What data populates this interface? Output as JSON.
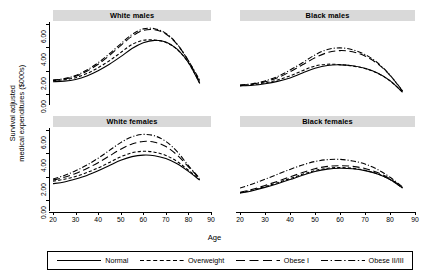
{
  "chart_data": {
    "type": "line",
    "title": "",
    "xlabel": "Age",
    "ylabel": "Survival adjusted\nmedical expenditures ($000s)",
    "xlim": [
      20,
      90
    ],
    "ylim": [
      0,
      6
    ],
    "xticks": [
      "20",
      "30",
      "40",
      "50",
      "60",
      "70",
      "80",
      "90"
    ],
    "yticks": [
      "0.00",
      "2.00",
      "4.00",
      "6.00"
    ],
    "grid": false,
    "legend_position": "bottom",
    "series_names": [
      "Normal",
      "Overweight",
      "Obese I",
      "Obese II/III"
    ],
    "line_styles": [
      "solid",
      "dashed",
      "long-dash",
      "dash-dot"
    ],
    "panels": [
      {
        "name": "White males",
        "x": [
          20,
          25,
          30,
          35,
          40,
          45,
          50,
          55,
          60,
          65,
          70,
          75,
          80,
          85
        ],
        "series": [
          {
            "name": "Normal",
            "values": [
              1.05,
              1.1,
              1.25,
              1.55,
              2.0,
              2.55,
              3.2,
              3.9,
              4.4,
              4.6,
              4.45,
              3.85,
              2.7,
              0.9
            ]
          },
          {
            "name": "Overweight",
            "values": [
              1.15,
              1.22,
              1.4,
              1.75,
              2.25,
              2.85,
              3.55,
              4.25,
              4.6,
              4.62,
              4.42,
              3.82,
              2.68,
              0.95
            ]
          },
          {
            "name": "Obese I",
            "values": [
              1.18,
              1.28,
              1.52,
              1.95,
              2.55,
              3.3,
              4.15,
              4.95,
              5.45,
              5.5,
              5.15,
              4.25,
              2.85,
              1.05
            ]
          },
          {
            "name": "Obese II/III",
            "values": [
              1.2,
              1.32,
              1.58,
              2.05,
              2.68,
              3.45,
              4.3,
              5.1,
              5.58,
              5.6,
              5.2,
              4.28,
              2.85,
              1.2
            ]
          }
        ]
      },
      {
        "name": "Black males",
        "x": [
          20,
          25,
          30,
          35,
          40,
          45,
          50,
          55,
          60,
          65,
          70,
          75,
          80,
          85
        ],
        "series": [
          {
            "name": "Normal",
            "values": [
              0.7,
              0.75,
              0.88,
              1.08,
              1.38,
              1.8,
              2.2,
              2.45,
              2.5,
              2.42,
              2.2,
              1.8,
              1.15,
              0.15
            ]
          },
          {
            "name": "Overweight",
            "values": [
              0.72,
              0.8,
              0.95,
              1.2,
              1.55,
              2.0,
              2.4,
              2.55,
              2.52,
              2.4,
              2.18,
              1.78,
              1.12,
              0.18
            ]
          },
          {
            "name": "Obese I",
            "values": [
              0.74,
              0.85,
              1.05,
              1.4,
              1.9,
              2.5,
              3.1,
              3.55,
              3.72,
              3.62,
              3.25,
              2.6,
              1.6,
              0.25
            ]
          },
          {
            "name": "Obese II/III",
            "values": [
              0.76,
              0.88,
              1.12,
              1.5,
              2.05,
              2.68,
              3.35,
              3.82,
              3.95,
              3.8,
              3.38,
              2.68,
              1.62,
              0.28
            ]
          }
        ]
      },
      {
        "name": "White females",
        "x": [
          20,
          25,
          30,
          35,
          40,
          45,
          50,
          55,
          60,
          65,
          70,
          75,
          80,
          85
        ],
        "series": [
          {
            "name": "Normal",
            "values": [
              1.4,
              1.55,
              1.8,
              2.1,
              2.5,
              2.95,
              3.4,
              3.72,
              3.85,
              3.8,
              3.55,
              3.1,
              2.45,
              1.7
            ]
          },
          {
            "name": "Overweight",
            "values": [
              1.6,
              1.78,
              2.02,
              2.35,
              2.75,
              3.22,
              3.7,
              4.05,
              4.18,
              4.1,
              3.82,
              3.3,
              2.55,
              1.75
            ]
          },
          {
            "name": "Obese I",
            "values": [
              1.7,
              1.95,
              2.28,
              2.7,
              3.2,
              3.78,
              4.35,
              4.8,
              5.02,
              4.95,
              4.58,
              3.85,
              2.85,
              1.82
            ]
          },
          {
            "name": "Obese II/III",
            "values": [
              1.8,
              2.1,
              2.5,
              3.0,
              3.58,
              4.25,
              4.92,
              5.42,
              5.62,
              5.5,
              5.02,
              4.15,
              2.95,
              1.85
            ]
          }
        ]
      },
      {
        "name": "Black females",
        "x": [
          20,
          25,
          30,
          35,
          40,
          45,
          50,
          55,
          60,
          65,
          70,
          75,
          80,
          85
        ],
        "series": [
          {
            "name": "Normal",
            "values": [
              0.58,
              0.8,
              1.08,
              1.4,
              1.75,
              2.12,
              2.45,
              2.65,
              2.72,
              2.68,
              2.52,
              2.22,
              1.75,
              1.02
            ]
          },
          {
            "name": "Overweight",
            "values": [
              0.62,
              0.85,
              1.15,
              1.48,
              1.84,
              2.2,
              2.52,
              2.72,
              2.78,
              2.72,
              2.55,
              2.24,
              1.76,
              1.04
            ]
          },
          {
            "name": "Obese I",
            "values": [
              0.66,
              0.92,
              1.25,
              1.6,
              1.98,
              2.35,
              2.68,
              2.88,
              2.94,
              2.88,
              2.7,
              2.35,
              1.82,
              1.08
            ]
          },
          {
            "name": "Obese II/III",
            "values": [
              1.02,
              1.38,
              1.78,
              2.2,
              2.62,
              3.0,
              3.3,
              3.46,
              3.48,
              3.35,
              3.08,
              2.62,
              1.95,
              1.12
            ]
          }
        ]
      }
    ]
  },
  "axes": {
    "y_title_line1": "Survival adjusted",
    "y_title_line2": "medical expenditures ($000s)",
    "x_title": "Age"
  },
  "panel_titles": {
    "top_left": "White males",
    "top_right": "Black males",
    "bottom_left": "White females",
    "bottom_right": "Black females"
  },
  "legend": {
    "items": [
      {
        "label": "Normal",
        "style": "solid"
      },
      {
        "label": "Overweight",
        "style": "dashed"
      },
      {
        "label": "Obese I",
        "style": "long-dash"
      },
      {
        "label": "Obese II/III",
        "style": "dash-dot"
      }
    ]
  },
  "colors": {
    "line": "#000000",
    "strip_background": "#d9d9d9",
    "plot_background": "#ffffff",
    "axis": "#000000"
  }
}
